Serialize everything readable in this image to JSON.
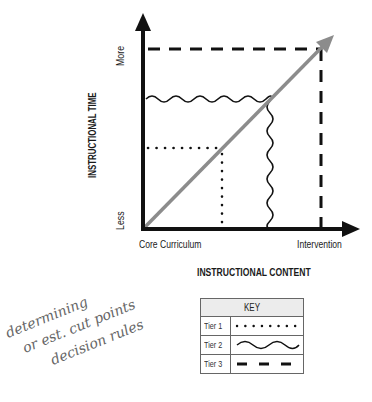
{
  "diagram": {
    "y_axis": {
      "title": "INSTRUCTIONAL TIME",
      "low_label": "Less",
      "high_label": "More"
    },
    "x_axis": {
      "title": "INSTRUCTIONAL CONTENT",
      "low_label": "Core Curriculum",
      "high_label": "Intervention"
    },
    "trend_arrow_color": "#8c8c8c",
    "tiers": [
      {
        "name": "Tier 1",
        "style": "dotted",
        "x": 222,
        "y": 148
      },
      {
        "name": "Tier 2",
        "style": "wavy",
        "x": 270,
        "y": 99
      },
      {
        "name": "Tier 3",
        "style": "dashed",
        "x": 321,
        "y": 49
      }
    ]
  },
  "key": {
    "title": "KEY",
    "rows": [
      {
        "label": "Tier 1",
        "line": "dotted"
      },
      {
        "label": "Tier 2",
        "line": "wavy"
      },
      {
        "label": "Tier 3",
        "line": "dashed"
      }
    ]
  },
  "handwriting": {
    "line1": "determining",
    "line2": "or est. cut points",
    "line3": "decision rules"
  }
}
